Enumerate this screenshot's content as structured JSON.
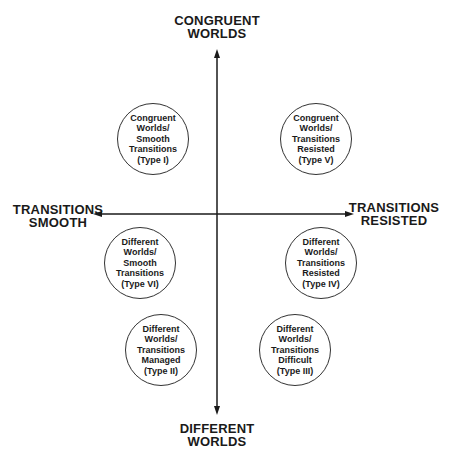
{
  "axes": {
    "top": [
      "CONGRUENT",
      "WORLDS"
    ],
    "bottom": [
      "DIFFERENT",
      "WORLDS"
    ],
    "left": [
      "TRANSITIONS",
      "SMOOTH"
    ],
    "right": [
      "TRANSITIONS",
      "RESISTED"
    ]
  },
  "types": [
    {
      "id": "type-i",
      "lines": [
        "Congruent",
        "Worlds/",
        "Smooth",
        "Transitions",
        "(Type I)"
      ]
    },
    {
      "id": "type-v",
      "lines": [
        "Congruent",
        "Worlds/",
        "Transitions",
        "Resisted",
        "(Type V)"
      ]
    },
    {
      "id": "type-vi",
      "lines": [
        "Different",
        "Worlds/",
        "Smooth",
        "Transitions",
        "(Type VI)"
      ]
    },
    {
      "id": "type-iv",
      "lines": [
        "Different",
        "Worlds/",
        "Transitions",
        "Resisted",
        "(Type IV)"
      ]
    },
    {
      "id": "type-ii",
      "lines": [
        "Different",
        "Worlds/",
        "Transitions",
        "Managed",
        "(Type II)"
      ]
    },
    {
      "id": "type-iii",
      "lines": [
        "Different",
        "Worlds/",
        "Transitions",
        "Difficult",
        "(Type III)"
      ]
    }
  ],
  "colors": {
    "ink": "#1a1a1a",
    "background": "#ffffff"
  }
}
